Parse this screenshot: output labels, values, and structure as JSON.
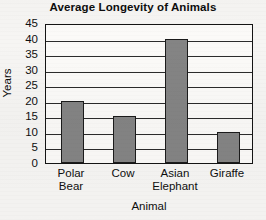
{
  "chart_data": {
    "type": "bar",
    "title": "Average Longevity of Animals",
    "xlabel": "Animal",
    "ylabel": "Years",
    "categories": [
      "Polar Bear",
      "Cow",
      "Asian Elephant",
      "Giraffe"
    ],
    "category_lines": [
      [
        "Polar",
        "Bear"
      ],
      [
        "Cow",
        ""
      ],
      [
        "Asian",
        "Elephant"
      ],
      [
        "Giraffe",
        ""
      ]
    ],
    "values": [
      20,
      15,
      40,
      10
    ],
    "ylim": [
      0,
      45
    ],
    "ytick_step": 5,
    "yticks": [
      45,
      40,
      35,
      30,
      25,
      20,
      15,
      10,
      5,
      0
    ],
    "grid": true,
    "legend": false,
    "bar_color": "#848484",
    "bar_border_color": "#1b1b1b",
    "axis_color": "#141414",
    "background_color": "#f6f5f3",
    "plot_background_color": "#fbfaf8"
  }
}
